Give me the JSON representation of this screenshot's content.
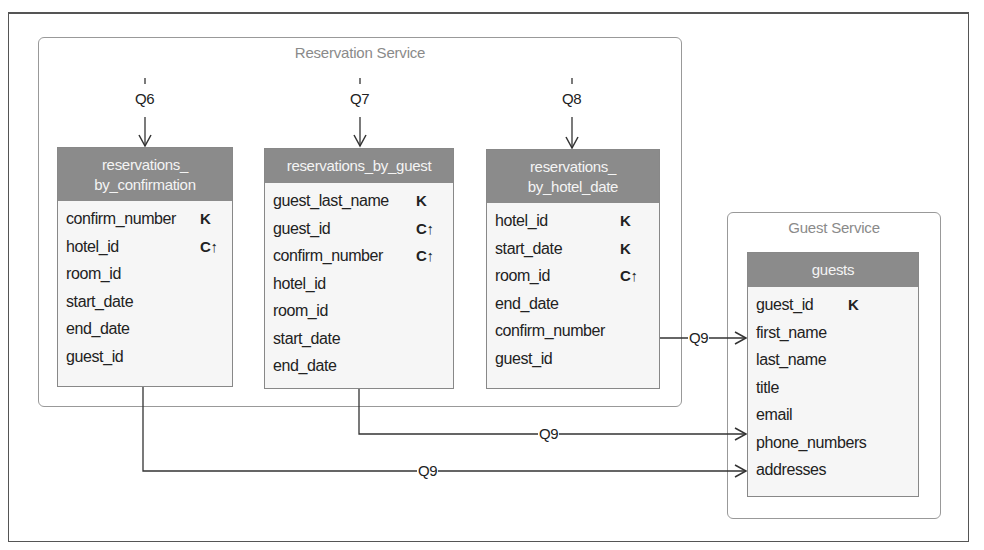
{
  "services": {
    "reservation": {
      "title": "Reservation Service"
    },
    "guest": {
      "title": "Guest Service"
    }
  },
  "queries": {
    "q6": "Q6",
    "q7": "Q7",
    "q8": "Q8",
    "q9": "Q9"
  },
  "tables": {
    "reservations_by_confirmation": {
      "title_line1": "reservations_",
      "title_line2": "by_confirmation",
      "columns": [
        {
          "name": "confirm_number",
          "key": "K"
        },
        {
          "name": "hotel_id",
          "key": "C↑"
        },
        {
          "name": "room_id",
          "key": ""
        },
        {
          "name": "start_date",
          "key": ""
        },
        {
          "name": "end_date",
          "key": ""
        },
        {
          "name": "guest_id",
          "key": ""
        }
      ]
    },
    "reservations_by_guest": {
      "title_line1": "reservations_by_guest",
      "columns": [
        {
          "name": "guest_last_name",
          "key": "K"
        },
        {
          "name": "guest_id",
          "key": "C↑"
        },
        {
          "name": "confirm_number",
          "key": "C↑"
        },
        {
          "name": "hotel_id",
          "key": ""
        },
        {
          "name": "room_id",
          "key": ""
        },
        {
          "name": "start_date",
          "key": ""
        },
        {
          "name": "end_date",
          "key": ""
        }
      ]
    },
    "reservations_by_hotel_date": {
      "title_line1": "reservations_",
      "title_line2": "by_hotel_date",
      "columns": [
        {
          "name": "hotel_id",
          "key": "K"
        },
        {
          "name": "start_date",
          "key": "K"
        },
        {
          "name": "room_id",
          "key": "C↑"
        },
        {
          "name": "end_date",
          "key": ""
        },
        {
          "name": "confirm_number",
          "key": ""
        },
        {
          "name": "guest_id",
          "key": ""
        }
      ]
    },
    "guests": {
      "title_line1": "guests",
      "columns": [
        {
          "name": "guest_id",
          "key": "K"
        },
        {
          "name": "first_name",
          "key": ""
        },
        {
          "name": "last_name",
          "key": ""
        },
        {
          "name": "title",
          "key": ""
        },
        {
          "name": "email",
          "key": ""
        },
        {
          "name": "phone_numbers",
          "key": ""
        },
        {
          "name": "addresses",
          "key": ""
        }
      ]
    }
  },
  "colors": {
    "header_fill": "#8b8b8b",
    "table_fill": "#f6f6f6",
    "line": "#333333",
    "service_border": "#999999"
  }
}
